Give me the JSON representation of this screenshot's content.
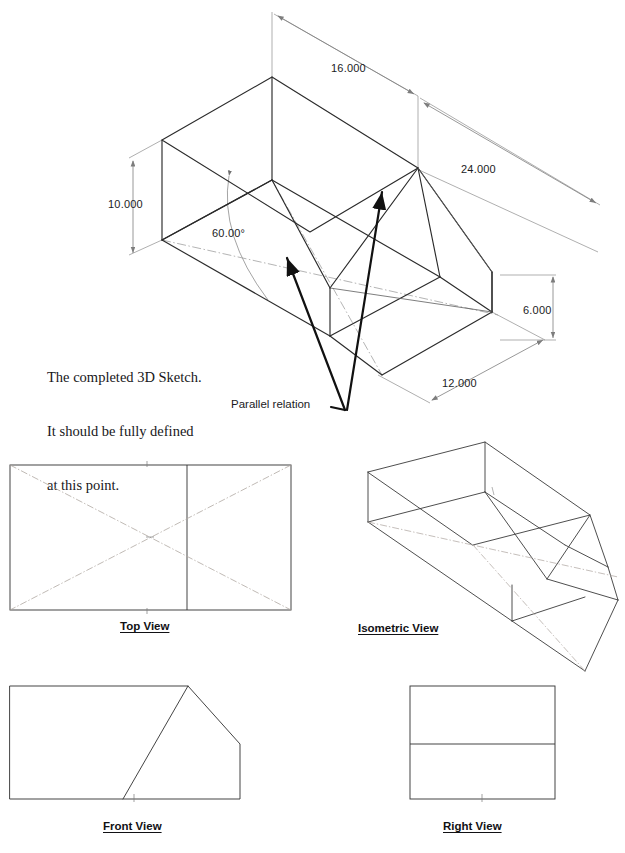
{
  "document": {
    "title": "SolidWorks 3D Sketch Tutorial Figure",
    "background_color": "#ffffff",
    "line_color": "#2b2b2b",
    "construction_line_color": "#9a9a9a",
    "text_color": "#17171a"
  },
  "note": {
    "lines": [
      "The completed 3D Sketch.",
      "It should be fully defined",
      "at this point."
    ],
    "line1": "The completed 3D Sketch.",
    "line2": "It should be fully defined",
    "line3": "at this point."
  },
  "callouts": [
    {
      "label": "Parallel relation",
      "x": 231,
      "y": 398
    }
  ],
  "callout_parallel": "Parallel relation",
  "dimensions": [
    {
      "name": "width-16",
      "value": "16.000",
      "x": 331,
      "y": 62,
      "unit": "in"
    },
    {
      "name": "length-24",
      "value": "24.000",
      "x": 461,
      "y": 163,
      "unit": "in"
    },
    {
      "name": "height-10",
      "value": "10.000",
      "x": 108,
      "y": 198,
      "unit": "in"
    },
    {
      "name": "angle-60",
      "value": "60.00°",
      "x": 212,
      "y": 227,
      "unit": "deg"
    },
    {
      "name": "height-6",
      "value": "6.000",
      "x": 523,
      "y": 304,
      "unit": "in"
    },
    {
      "name": "width-12",
      "value": "12.000",
      "x": 442,
      "y": 377,
      "unit": "in"
    }
  ],
  "dim_16": "16.000",
  "dim_24": "24.000",
  "dim_10": "10.000",
  "dim_60": "60.00°",
  "dim_6": "6.000",
  "dim_12": "12.000",
  "views": [
    {
      "name": "top-view",
      "label": "Top View",
      "x": 120,
      "y": 620
    },
    {
      "name": "isometric-view",
      "label": "Isometric View",
      "x": 358,
      "y": 622
    },
    {
      "name": "front-view",
      "label": "Front View",
      "x": 103,
      "y": 820
    },
    {
      "name": "right-view",
      "label": "Right View",
      "x": 443,
      "y": 820
    }
  ],
  "view_top": "Top View",
  "view_isometric": "Isometric View",
  "view_front": "Front View",
  "view_right": "Right View",
  "geometry": {
    "main_sketch": {
      "description": "3D wireframe box with angled cut, isometric projection, fully dimensioned",
      "model_dims": {
        "length": 24.0,
        "width": 16.0,
        "height": 10.0,
        "step_height": 6.0,
        "step_width": 12.0,
        "angle": 60.0
      }
    }
  }
}
